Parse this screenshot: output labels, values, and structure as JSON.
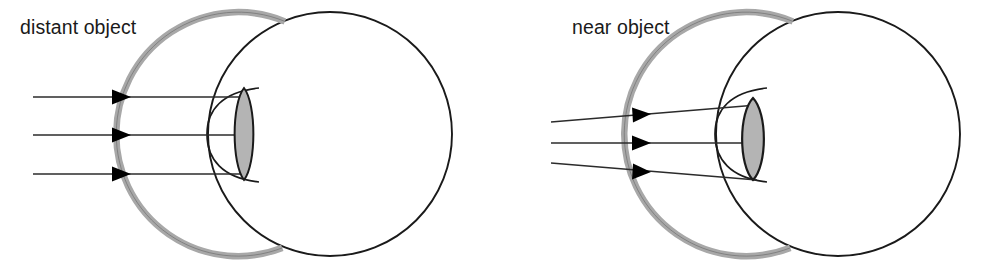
{
  "figure": {
    "background_color": "#ffffff",
    "width": 988,
    "height": 274
  },
  "colors": {
    "outline": "#1a1a1a",
    "retina_band": "#a8a8a8",
    "retina_band_stroke": "#6d6d6d",
    "lens_fill": "#b4b4b4",
    "lens_stroke": "#1a1a1a",
    "ray_line": "#2b2b2b",
    "arrow_head": "#000000",
    "label_text": "#1a1a1a",
    "page_background": "#ffffff"
  },
  "panels": [
    {
      "id": "distant",
      "label": "distant object",
      "label_position": {
        "x": 20,
        "y": 34
      },
      "ray_type": "parallel",
      "ray_count": 3,
      "rays": [
        {
          "x1": 33,
          "y1": 97,
          "x2": 247,
          "y2": 97,
          "arrow_x": 112,
          "arrow_y": 97
        },
        {
          "x1": 33,
          "y1": 135,
          "x2": 247,
          "y2": 135,
          "arrow_x": 112,
          "arrow_y": 135
        },
        {
          "x1": 33,
          "y1": 174,
          "x2": 247,
          "y2": 174,
          "arrow_x": 112,
          "arrow_y": 174
        }
      ],
      "eyeball": {
        "cx": 330,
        "cy": 134,
        "r": 122
      },
      "cornea": {
        "apex_x": 209,
        "top_y": 88,
        "bottom_y": 182
      },
      "lens": {
        "cx": 244,
        "cy": 134,
        "half_width": 12.5,
        "half_height": 46,
        "state": "flat / relaxed"
      },
      "retina": {
        "start_angle_deg": 247,
        "end_angle_deg": 110,
        "thickness": 6
      }
    },
    {
      "id": "near",
      "label": "near object",
      "label_position": {
        "x": 572,
        "y": 34
      },
      "ray_type": "diverging",
      "ray_count": 3,
      "rays": [
        {
          "x1": 551,
          "y1": 122,
          "x2": 757,
          "y2": 105,
          "arrow_x": 636,
          "arrow_y": 115,
          "angle_deg": -4.7
        },
        {
          "x1": 551,
          "y1": 143,
          "x2": 757,
          "y2": 143,
          "arrow_x": 636,
          "arrow_y": 143,
          "angle_deg": 0
        },
        {
          "x1": 551,
          "y1": 163,
          "x2": 757,
          "y2": 180,
          "arrow_x": 636,
          "arrow_y": 170,
          "angle_deg": 4.7
        }
      ],
      "eyeball": {
        "cx": 838,
        "cy": 134,
        "r": 122
      },
      "cornea": {
        "apex_x": 717,
        "top_y": 88,
        "bottom_y": 182
      },
      "lens": {
        "cx": 753,
        "cy": 139,
        "half_width": 14.5,
        "half_height": 41,
        "state": "rounded / accommodated"
      },
      "retina": {
        "start_angle_deg": 247,
        "end_angle_deg": 110,
        "thickness": 6
      }
    }
  ],
  "legend_note": "",
  "icons": {
    "arrow_head": "solid-triangle-right"
  }
}
